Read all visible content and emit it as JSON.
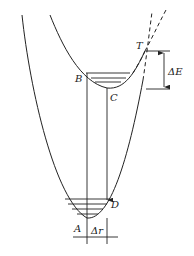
{
  "diagram": {
    "type": "potential-energy-curves",
    "labels": {
      "T": "T",
      "B": "B",
      "C": "C",
      "D": "D",
      "A": "A",
      "delta_E": "ΔE",
      "delta_r": "Δr"
    },
    "colors": {
      "line": "#222222",
      "background": "#ffffff"
    },
    "curves": [
      {
        "name": "ground-state-well",
        "style": "solid",
        "minimum_label": "A"
      },
      {
        "name": "excited-state-well",
        "style": "solid",
        "minimum_label": "C"
      },
      {
        "name": "ground-state-continuation",
        "style": "dashed"
      },
      {
        "name": "excited-state-continuation",
        "style": "dashed"
      }
    ],
    "transitions": [
      {
        "from": "A",
        "to": "B",
        "style": "vertical-line"
      },
      {
        "from": "C",
        "to": "D",
        "style": "vertical-arrow"
      }
    ],
    "annotations": {
      "crossing_point": "T",
      "energy_gap": "ΔE",
      "displacement": "Δr"
    }
  }
}
